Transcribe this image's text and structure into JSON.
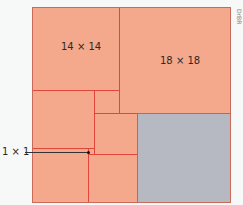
{
  "diagram": {
    "colors": {
      "tile_fill": "#f4a88c",
      "tile_border": "#e0463a",
      "gray_fill": "#b6b9c1",
      "background": "#f7f8f8"
    },
    "labels": {
      "square_14": "14 × 14",
      "square_18": "18 × 18",
      "square_1": "1 × 1"
    },
    "credit": "DrBR"
  }
}
